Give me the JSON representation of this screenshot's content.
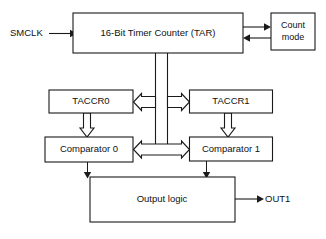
{
  "diagram": {
    "stroke_color": "#1a1a1a",
    "background_color": "#ffffff",
    "blocks": [
      {
        "id": "tar",
        "label": "16-Bit Timer Counter (TAR)"
      },
      {
        "id": "count_mode",
        "label_line1": "Count",
        "label_line2": "mode"
      },
      {
        "id": "taccr0",
        "label": "TACCR0"
      },
      {
        "id": "taccr1",
        "label": "TACCR1"
      },
      {
        "id": "comparator0",
        "label": "Comparator 0"
      },
      {
        "id": "comparator1",
        "label": "Comparator 1"
      },
      {
        "id": "output_logic",
        "label": "Output logic"
      }
    ],
    "signals": [
      {
        "id": "smclk",
        "label": "SMCLK",
        "direction": "input"
      },
      {
        "id": "out1",
        "label": "OUT1",
        "direction": "output"
      }
    ],
    "connections": [
      {
        "from": "smclk",
        "to": "tar",
        "style": "solid-arrow"
      },
      {
        "from": "tar",
        "to": "count_mode",
        "style": "solid-arrow"
      },
      {
        "from": "count_mode",
        "to": "tar",
        "style": "solid-arrow"
      },
      {
        "from": "tar",
        "to": "taccr0",
        "style": "hollow-bus-arrow"
      },
      {
        "from": "tar",
        "to": "taccr1",
        "style": "hollow-bus-arrow"
      },
      {
        "from": "taccr0",
        "to": "comparator0",
        "style": "hollow-arrow-down"
      },
      {
        "from": "taccr1",
        "to": "comparator1",
        "style": "hollow-arrow-down"
      },
      {
        "from": "tar",
        "to": "comparator0",
        "style": "hollow-bus-arrow"
      },
      {
        "from": "tar",
        "to": "comparator1",
        "style": "hollow-bus-arrow"
      },
      {
        "from": "comparator0",
        "to": "output_logic",
        "style": "solid-arrow"
      },
      {
        "from": "comparator1",
        "to": "output_logic",
        "style": "solid-arrow"
      },
      {
        "from": "output_logic",
        "to": "out1",
        "style": "solid-arrow"
      }
    ]
  }
}
